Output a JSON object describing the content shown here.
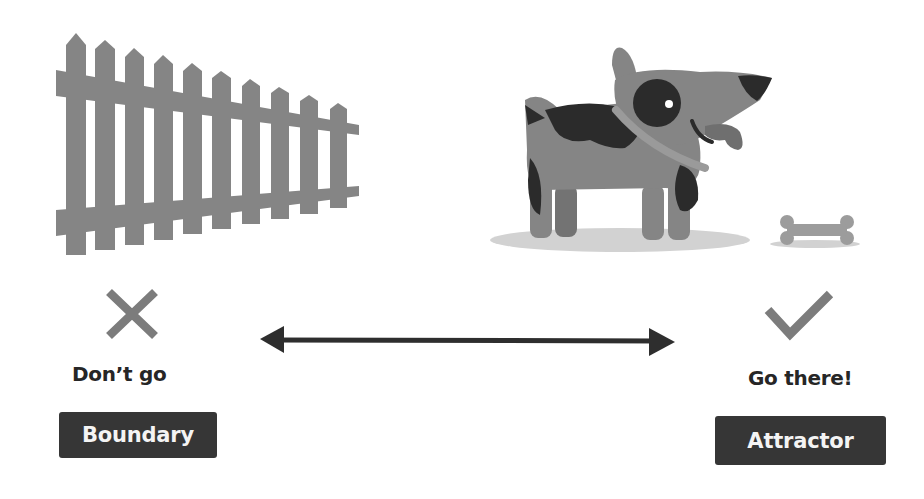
{
  "left": {
    "illustration": "picket-fence",
    "icon": "x-mark",
    "caption": "Don’t go",
    "tag": "Boundary"
  },
  "right": {
    "illustration": "dog-with-bone",
    "icon": "check-mark",
    "caption": "Go there!",
    "tag": "Attractor"
  },
  "connector": "double-headed-arrow",
  "colors": {
    "illustration_gray": "#858585",
    "spot_dark": "#2b2b2b",
    "text_dark": "#262626",
    "tag_bg": "#363636",
    "tag_text": "#f4f4f4",
    "arrow": "#2e2e2e",
    "shadow": "#d2d2d2"
  }
}
